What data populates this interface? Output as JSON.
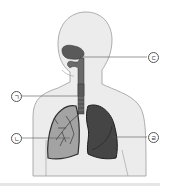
{
  "diagram": {
    "labels": [
      {
        "id": "giyeok",
        "text": "ㄱ",
        "target": "trachea",
        "x": 11,
        "y": 91
      },
      {
        "id": "nieun",
        "text": "ㄴ",
        "target": "lung (left in image, bronchial tree shown)",
        "x": 11,
        "y": 133
      },
      {
        "id": "digeut",
        "text": "ㄷ",
        "target": "nasal cavity",
        "x": 148,
        "y": 52
      },
      {
        "id": "rieul",
        "text": "ㄹ",
        "target": "lung (right in image)",
        "x": 148,
        "y": 132
      }
    ],
    "colors": {
      "body_fill": "#ececec",
      "body_outline": "#9a9a9a",
      "organ_dark": "#4a4a4a",
      "lung_left_fill": "#9a9a9a",
      "lung_right_fill": "#3f3f3f",
      "leader_line": "#555555"
    }
  }
}
